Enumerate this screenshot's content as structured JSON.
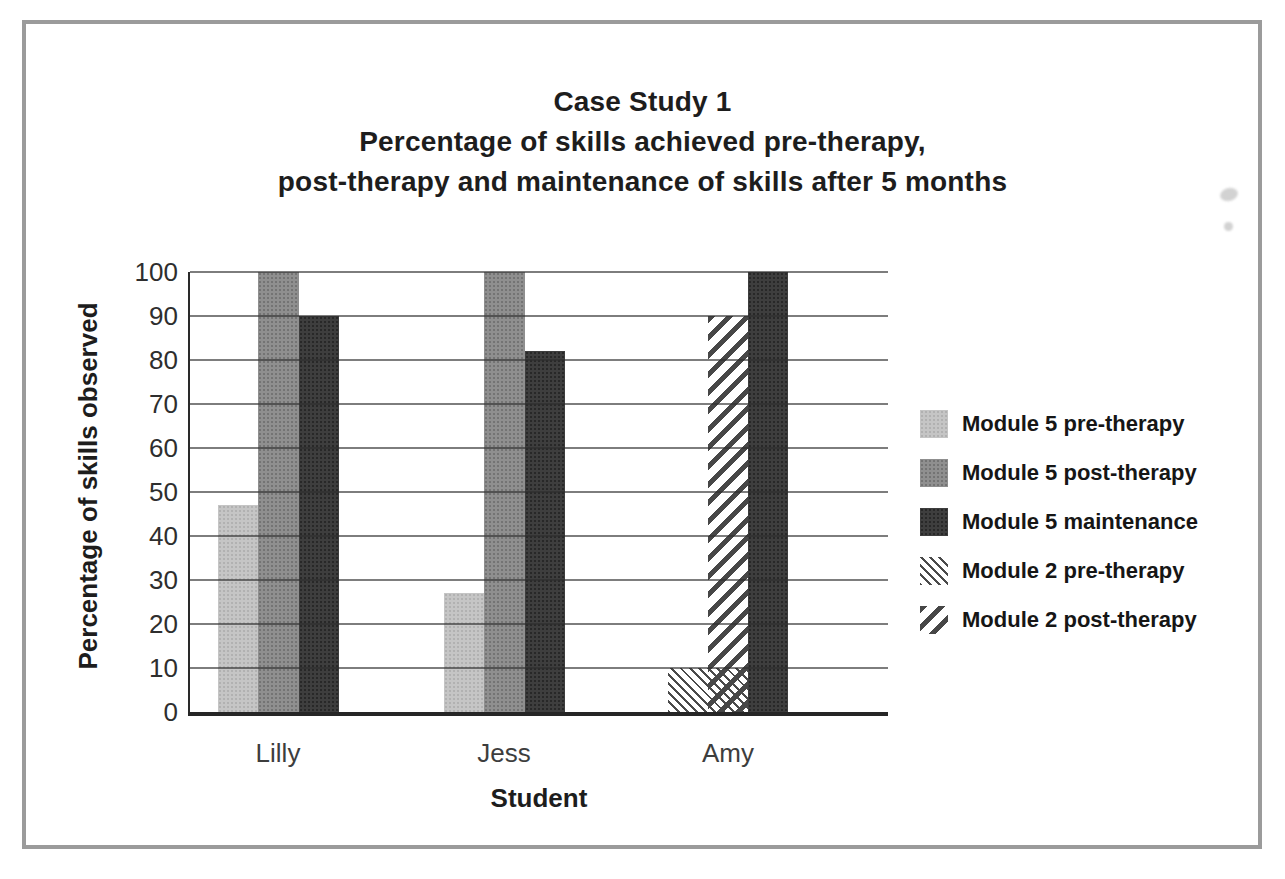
{
  "page": {
    "background": "#ffffff",
    "frame_color": "#9b9b9b"
  },
  "title": {
    "line1": "Case Study 1",
    "line2": "Percentage of skills achieved pre-therapy,",
    "line3": "post-therapy and maintenance of skills after 5 months"
  },
  "axes": {
    "y_title": "Percentage of skills observed",
    "x_title": "Student"
  },
  "legend": {
    "position": "right",
    "items": [
      {
        "label": "Module 5 pre-therapy",
        "style": "solid-light",
        "color": "#c5c5c5"
      },
      {
        "label": "Module 5 post-therapy",
        "style": "solid-medium",
        "color": "#8f8f8f"
      },
      {
        "label": "Module 5 maintenance",
        "style": "solid-dark",
        "color": "#3e3e3e"
      },
      {
        "label": "Module 2 pre-therapy",
        "style": "hatch-thin",
        "color": "#4a4a4a"
      },
      {
        "label": "Module 2 post-therapy",
        "style": "hatch-thick",
        "color": "#474747"
      }
    ]
  },
  "chart_data": {
    "type": "bar",
    "xlabel": "Student",
    "ylabel": "Percentage of skills observed",
    "ylim": [
      0,
      100
    ],
    "ytick_step": 10,
    "yticks": [
      0,
      10,
      20,
      30,
      40,
      50,
      60,
      70,
      80,
      90,
      100
    ],
    "grid": true,
    "legend_position": "right",
    "categories": [
      "Lilly",
      "Jess",
      "Amy"
    ],
    "series": [
      {
        "name": "Module 5 pre-therapy",
        "style": "solid-light",
        "values": [
          47,
          27,
          null
        ]
      },
      {
        "name": "Module 5 post-therapy",
        "style": "solid-medium",
        "values": [
          100,
          100,
          null
        ]
      },
      {
        "name": "Module 5 maintenance",
        "style": "solid-dark",
        "values": [
          90,
          82,
          100
        ]
      },
      {
        "name": "Module 2 pre-therapy",
        "style": "hatch-thin",
        "values": [
          null,
          null,
          10
        ]
      },
      {
        "name": "Module 2 post-therapy",
        "style": "hatch-thick",
        "values": [
          null,
          null,
          90
        ]
      }
    ],
    "bar_order": [
      [
        "Module 5 pre-therapy",
        "Module 5 post-therapy",
        "Module 5 maintenance"
      ],
      [
        "Module 5 pre-therapy",
        "Module 5 post-therapy",
        "Module 5 maintenance"
      ],
      [
        "Module 2 pre-therapy",
        "Module 2 post-therapy",
        "Module 5 maintenance"
      ]
    ]
  }
}
